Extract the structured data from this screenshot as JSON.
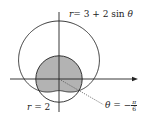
{
  "diagram": {
    "type": "polar-region",
    "origin_px": [
      59,
      79
    ],
    "unit_px": 11.6,
    "curves": [
      {
        "name": "limacon",
        "equation_label": "r = 3 + 2 sin θ",
        "color": "#222222"
      },
      {
        "name": "circle",
        "equation_label": "r = 2",
        "color": "#222222"
      }
    ],
    "shaded_region": {
      "description": "region inside both r = 2 and r = 3 + 2 sin θ",
      "fill": "#b3b3b3"
    },
    "ray": {
      "label": "θ = −π/6",
      "style": "dotted"
    },
    "labels": {
      "limacon": {
        "lhs": "r",
        "rhs": "= 3 + 2 sin ",
        "var": "θ"
      },
      "circle": {
        "lhs": "r",
        "rhs": " = 2"
      },
      "ray": {
        "lhs": "θ",
        "rhs": " = −",
        "num": "π",
        "den": "6"
      }
    }
  }
}
